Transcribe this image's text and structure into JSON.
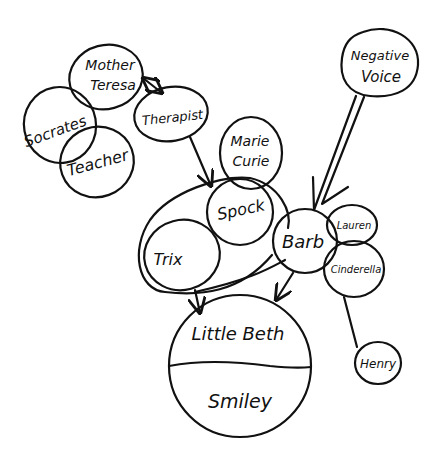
{
  "diagram": {
    "type": "hand-drawn relationship map",
    "colors": {
      "ink": "#111111",
      "background": "#ffffff"
    },
    "nodes": {
      "mother_teresa": {
        "line1": "Mother",
        "line2": "Teresa"
      },
      "socrates": {
        "label": "Socrates"
      },
      "teacher": {
        "label": "Teacher"
      },
      "therapist": {
        "label": "Therapist"
      },
      "marie_curie": {
        "line1": "Marie",
        "line2": "Curie"
      },
      "negative_voice": {
        "line1": "Negative",
        "line2": "Voice"
      },
      "spock": {
        "label": "Spock"
      },
      "trix": {
        "label": "Trix"
      },
      "barb": {
        "label": "Barb"
      },
      "lauren": {
        "label": "Lauren"
      },
      "cinderella": {
        "label": "Cinderella"
      },
      "henry": {
        "label": "Henry"
      },
      "little_beth": {
        "label": "Little Beth"
      },
      "smiley": {
        "label": "Smiley"
      }
    },
    "edges": [
      {
        "from": "Mother Teresa",
        "to": "Therapist",
        "type": "bidirectional-arrow"
      },
      {
        "from": "Therapist",
        "to": "Spock",
        "type": "arrow"
      },
      {
        "from": "Negative Voice",
        "to": "Barb",
        "type": "wide-arrow"
      },
      {
        "from": "Trix",
        "to": "Little Beth",
        "type": "arrow"
      },
      {
        "from": "Barb",
        "to": "Little Beth",
        "type": "arrow"
      },
      {
        "from": "Cinderella",
        "to": "Henry",
        "type": "line"
      },
      {
        "from": "Spock/Trix group",
        "to": "Barb",
        "type": "line"
      }
    ],
    "groups": [
      {
        "name": "outer loop",
        "members": [
          "Spock",
          "Trix"
        ]
      }
    ]
  }
}
